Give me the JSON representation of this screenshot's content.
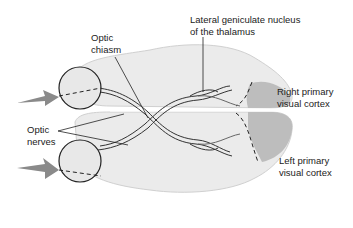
{
  "labels": {
    "optic_chiasm": [
      "Optic",
      "chiasm"
    ],
    "lgn": [
      "Lateral geniculate nucleus",
      "of the thalamus"
    ],
    "right_cortex": [
      "Right primary",
      "visual cortex"
    ],
    "left_cortex": [
      "Left primary",
      "visual cortex"
    ],
    "optic_nerves": [
      "Optic",
      "nerves"
    ]
  },
  "colors": {
    "brain_fill": "#ebebeb",
    "cortex_fill": "#bdbdbd",
    "arrow_fill": "#8a8a8a",
    "line": "#222222"
  },
  "arrows": [
    {
      "direction": "right",
      "target": "top-eye"
    },
    {
      "direction": "right",
      "target": "bottom-eye"
    }
  ]
}
